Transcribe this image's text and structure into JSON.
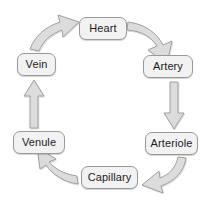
{
  "diagram": {
    "type": "cycle",
    "direction": "clockwise",
    "colors": {
      "node_fill": "#f2f2f2",
      "node_border": "#9a9a9a",
      "node_text": "#1c1c1c",
      "arrow_fill": "#dcdcdc",
      "arrow_border": "#9e9e9e",
      "background": "#ffffff"
    },
    "nodes": [
      {
        "id": "heart",
        "label": "Heart"
      },
      {
        "id": "artery",
        "label": "Artery"
      },
      {
        "id": "arteriole",
        "label": "Arteriole"
      },
      {
        "id": "capillary",
        "label": "Capillary"
      },
      {
        "id": "venule",
        "label": "Venule"
      },
      {
        "id": "vein",
        "label": "Vein"
      }
    ],
    "arrows": [
      {
        "id": "heart-to-artery",
        "from": "Heart",
        "to": "Artery",
        "shape": "curved"
      },
      {
        "id": "artery-to-arteriole",
        "from": "Artery",
        "to": "Arteriole",
        "shape": "straight-down"
      },
      {
        "id": "arteriole-to-capillary",
        "from": "Arteriole",
        "to": "Capillary",
        "shape": "curved"
      },
      {
        "id": "capillary-to-venule",
        "from": "Capillary",
        "to": "Venule",
        "shape": "curved"
      },
      {
        "id": "venule-to-vein",
        "from": "Venule",
        "to": "Vein",
        "shape": "straight-up"
      },
      {
        "id": "vein-to-heart",
        "from": "Vein",
        "to": "Heart",
        "shape": "curved"
      }
    ]
  }
}
